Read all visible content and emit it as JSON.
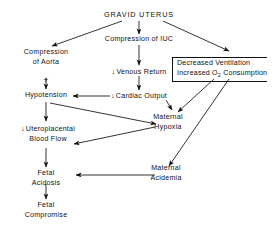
{
  "diagram": {
    "title": "GRAVID UTERUS",
    "nodes": {
      "gravid_uterus": "GRAVID UTERUS",
      "compression_aorta_l1": "Compression",
      "compression_aorta_l2": "of Aorta",
      "plus": "+",
      "compression_iuc": "Compression of IUC",
      "venous_return_arrow": "↓",
      "venous_return": "Venous Return",
      "cardiac_output_arrow": "↓",
      "cardiac_output": "Cardiac Output",
      "hypotension": "Hypotension",
      "decreased_ventilation": "Decreased Ventilation",
      "increased_o2_consumption_pre": "Increased O",
      "increased_o2_consumption_sub": "2",
      "increased_o2_consumption_post": " Consumption",
      "maternal_hypoxia_l1": "Maternal",
      "maternal_hypoxia_l2": "Hypoxia",
      "uteroplacental_arrow": "↓",
      "uteroplacental_l1": "Uteroplacental",
      "uteroplacental_l2": "Blood Flow",
      "maternal_acidemia_l1": "Maternal",
      "maternal_acidemia_l2": "Acidemia",
      "fetal_acidosis_l1": "Fetal",
      "fetal_acidosis_l2": "Acidosis",
      "fetal_compromise_l1": "Fetal",
      "fetal_compromise_l2": "Compromise"
    },
    "colors": {
      "ink": "#111111",
      "background": "#ffffff"
    }
  }
}
